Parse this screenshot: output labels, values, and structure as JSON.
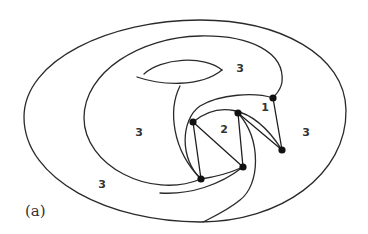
{
  "figure": {
    "caption": "(a)",
    "colors": {
      "background": "#ffffff",
      "stroke": "#2a2a2a",
      "vertex": "#111111"
    },
    "region_labels": [
      {
        "id": "region-top",
        "text": "3",
        "x": 240,
        "y": 68
      },
      {
        "id": "region-left-inner",
        "text": "3",
        "x": 139,
        "y": 132
      },
      {
        "id": "region-left-outer",
        "text": "3",
        "x": 102,
        "y": 184
      },
      {
        "id": "region-right",
        "text": "3",
        "x": 306,
        "y": 132
      },
      {
        "id": "region-one",
        "text": "1",
        "x": 265,
        "y": 107
      },
      {
        "id": "region-two",
        "text": "2",
        "x": 224,
        "y": 129
      }
    ],
    "vertices": [
      {
        "id": "v1",
        "x": 193,
        "y": 122
      },
      {
        "id": "v2",
        "x": 238,
        "y": 113
      },
      {
        "id": "v3",
        "x": 273,
        "y": 98
      },
      {
        "id": "v4",
        "x": 282,
        "y": 150
      },
      {
        "id": "v5",
        "x": 201,
        "y": 179
      },
      {
        "id": "v6",
        "x": 243,
        "y": 167
      }
    ]
  }
}
